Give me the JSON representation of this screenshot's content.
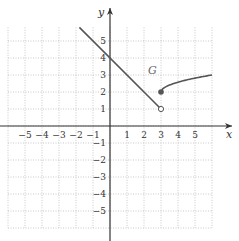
{
  "chart_data": {
    "type": "line",
    "title": "",
    "xlabel": "x",
    "ylabel": "y",
    "xlim": [
      -6,
      6
    ],
    "ylim": [
      -6,
      6
    ],
    "grid": true,
    "x_ticks": [
      "-5",
      "-4",
      "-3",
      "-2",
      "-1",
      "1",
      "2",
      "3",
      "4",
      "5"
    ],
    "y_ticks": [
      "5",
      "4",
      "3",
      "2",
      "1",
      "-1",
      "-2",
      "-3",
      "-4",
      "-5"
    ],
    "function_label": "G",
    "series": [
      {
        "name": "G piece 1 (linear, y = 4 - x)",
        "x": [
          -1.8,
          3
        ],
        "y": [
          5.8,
          1
        ],
        "end": {
          "x": 3,
          "y": 1,
          "marker": "open"
        }
      },
      {
        "name": "G piece 2 (increasing curve)",
        "x": [
          3,
          4,
          5,
          6
        ],
        "y": [
          2,
          2.5,
          2.75,
          3
        ],
        "start": {
          "x": 3,
          "y": 2,
          "marker": "closed"
        }
      }
    ],
    "colors": {
      "line": "#555555",
      "grid": "#bbbbbb",
      "axis": "#333333"
    }
  }
}
